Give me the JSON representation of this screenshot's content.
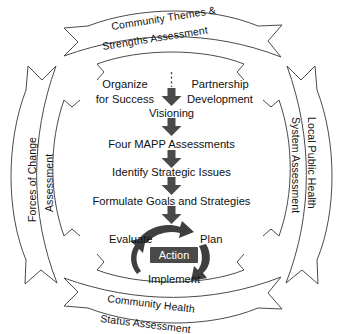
{
  "diagram": {
    "colors": {
      "outline": "#4a4a4a",
      "arrow_fill": "#4a4a4a",
      "action_box": "#4a4a4a",
      "action_text": "#ffffff",
      "text": "#111111",
      "background": "#ffffff"
    },
    "outer_banners": {
      "top": {
        "line1": "Community Themes &",
        "line2": "Strengths Assessment"
      },
      "left": {
        "line1": "Forces of Change",
        "line2": "Assessment"
      },
      "right": {
        "line1": "Local Public Health",
        "line2": "System Assessment"
      },
      "bottom": {
        "line1": "Community Health",
        "line2": "Status Assessment"
      }
    },
    "center_steps": {
      "organize": {
        "line1": "Organize",
        "line2": "for Success"
      },
      "partnership": {
        "line1": "Partnership",
        "line2": "Development"
      },
      "visioning": "Visioning",
      "assessments": "Four MAPP Assessments",
      "strategic_issues": "Identify Strategic Issues",
      "goals": "Formulate Goals and Strategies"
    },
    "action_cycle": {
      "center": "Action",
      "evaluate": "Evaluate",
      "plan": "Plan",
      "implement": "Implement"
    }
  }
}
